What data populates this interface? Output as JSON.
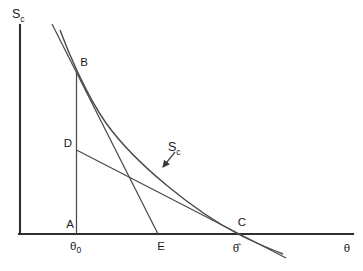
{
  "figure": {
    "type": "score-function-diagram",
    "colors": {
      "background": "#ffffff",
      "axis": "#2f2f2f",
      "line": "#4a4a4a",
      "text": "#1a1a1a"
    }
  },
  "labels": {
    "y_axis": {
      "base": "S",
      "sub": "c"
    },
    "x_axis": "θ",
    "curve": {
      "base": "S",
      "sub": "c"
    },
    "points": {
      "A": "A",
      "B": "B",
      "C": "C",
      "D": "D",
      "E": "E"
    },
    "ticks": {
      "theta0": {
        "base": "θ",
        "sub": "0"
      },
      "theta_hat": "θ̂"
    }
  },
  "geometry": {
    "y_axis": {
      "x1": 20,
      "y1": 25,
      "x2": 20,
      "y2": 234
    },
    "x_axis": {
      "x1": 19,
      "y1": 234,
      "x2": 353,
      "y2": 234
    },
    "theta0_vertical": {
      "x1": 76.5,
      "y1": 72,
      "x2": 76.5,
      "y2": 234
    },
    "tangent_at_B": {
      "x1": 52,
      "y1": 24,
      "x2": 158,
      "y2": 234
    },
    "tangent_at_C": {
      "x1": 76.5,
      "y1": 150,
      "x2": 286,
      "y2": 258
    },
    "curve_path": "M 60 30 C 67 49 85 93 106 123 C 136 165 196 212 238 234 C 253 242 268 248 283 254",
    "pointer_arrow": {
      "x1": 175,
      "y1": 152,
      "x2": 163,
      "y2": 167
    }
  },
  "key_points": {
    "A": {
      "x": 76.5,
      "y": 234
    },
    "B": {
      "x": 76.5,
      "y": 72
    },
    "C": {
      "x": 238,
      "y": 234
    },
    "D": {
      "x": 76.5,
      "y": 150
    },
    "E": {
      "x": 158,
      "y": 234
    },
    "theta0_x": 76.5,
    "theta_hat_x": 237
  }
}
